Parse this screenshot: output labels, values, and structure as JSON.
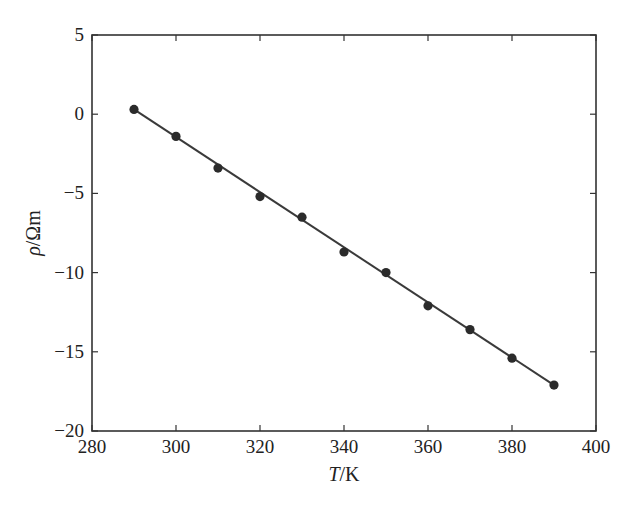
{
  "chart_data": {
    "type": "scatter",
    "title": "",
    "xlabel": "T/K",
    "xlabel_italic_part": "T",
    "xlabel_unit": "/K",
    "ylabel": "ρ/Ωm",
    "ylabel_italic_part": "ρ",
    "ylabel_unit": "/Ωm",
    "xlim": [
      280,
      400
    ],
    "ylim": [
      -20,
      5
    ],
    "xticks": [
      280,
      300,
      320,
      340,
      360,
      380,
      400
    ],
    "yticks": [
      5,
      0,
      -5,
      -10,
      -15,
      -20
    ],
    "grid": false,
    "legend": null,
    "series": [
      {
        "name": "measured",
        "kind": "markers",
        "x": [
          290,
          300,
          310,
          320,
          330,
          340,
          350,
          360,
          370,
          380,
          390
        ],
        "y": [
          0.3,
          -1.4,
          -3.4,
          -5.2,
          -6.5,
          -8.7,
          -10.0,
          -12.1,
          -13.6,
          -15.4,
          -17.1
        ]
      },
      {
        "name": "linear fit",
        "kind": "line",
        "x": [
          290,
          390
        ],
        "y": [
          0.3,
          -17.1
        ]
      }
    ],
    "colors": {
      "marker": "#2b2b2b",
      "line": "#3a3a3a",
      "axes": "#333333"
    }
  }
}
